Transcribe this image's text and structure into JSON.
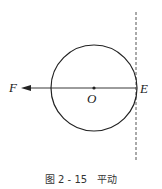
{
  "diagram": {
    "labels": {
      "F": "F",
      "O": "O",
      "E": "E"
    },
    "caption": "图 2 - 15　平动",
    "colors": {
      "stroke": "#222222",
      "dashed": "#555555"
    }
  }
}
